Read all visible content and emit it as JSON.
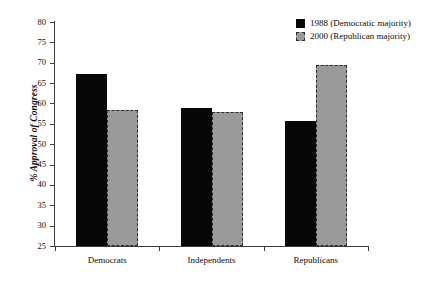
{
  "chart_data": {
    "type": "bar",
    "title": "",
    "xlabel": "",
    "ylabel": "% Approval of Congress",
    "ylim": [
      25,
      80
    ],
    "ytick_step": 5,
    "yticks": [
      80,
      75,
      70,
      65,
      60,
      55,
      50,
      45,
      40,
      35,
      30,
      25
    ],
    "ytick_labels": [
      "80",
      "75",
      "70",
      "65",
      "60",
      "55",
      "50",
      "45",
      "40",
      "35",
      "30",
      "25"
    ],
    "categories": [
      "Democrats",
      "Independents",
      "Republicans"
    ],
    "grid": false,
    "legend_position": "top-right",
    "series": [
      {
        "name": "1988 (Democratic majority)",
        "color": "#070707",
        "fill": "solid",
        "values": [
          67.2,
          59.0,
          55.6
        ]
      },
      {
        "name": "2000 (Republican majority)",
        "color": "#9a9a9a",
        "fill": "solid-dashed-border",
        "border_color": "#2b2b2b",
        "values": [
          58.5,
          57.8,
          69.5
        ]
      }
    ]
  },
  "legend": {
    "entries": [
      {
        "label": "1988 (Democratic majority)",
        "swatch": "black-square-icon"
      },
      {
        "label": "2000 (Republican majority)",
        "swatch": "gray-dashed-square-icon"
      }
    ]
  },
  "axes": {
    "y_title": "% Approval of Congress"
  }
}
